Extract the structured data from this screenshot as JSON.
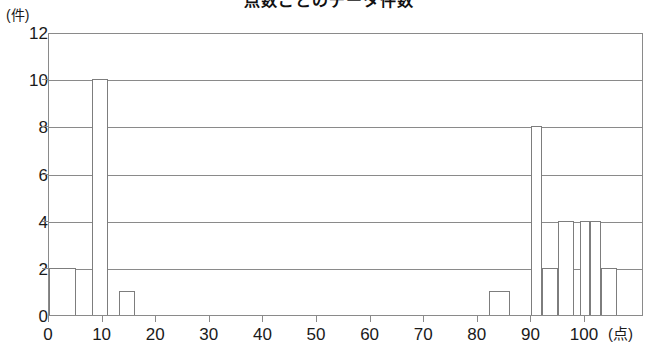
{
  "chart_data": {
    "type": "bar",
    "title": "点数ごとのデータ件数",
    "xlabel": "点",
    "ylabel": "件",
    "x_unit_label": "(点)",
    "y_unit_label": "(件)",
    "xlim": [
      0,
      111
    ],
    "ylim": [
      0,
      12
    ],
    "grid": true,
    "legend": null,
    "x_ticks": [
      0,
      10,
      20,
      30,
      40,
      50,
      60,
      70,
      80,
      90,
      100
    ],
    "y_ticks": [
      0,
      2,
      4,
      6,
      8,
      10,
      12
    ],
    "bin_width": 5,
    "bins": [
      {
        "start": 0,
        "end": 5,
        "value": 2
      },
      {
        "start": 8,
        "end": 11,
        "value": 10
      },
      {
        "start": 13,
        "end": 16,
        "value": 1
      },
      {
        "start": 82,
        "end": 86,
        "value": 1
      },
      {
        "start": 90,
        "end": 92,
        "value": 8
      },
      {
        "start": 92,
        "end": 95,
        "value": 2
      },
      {
        "start": 95,
        "end": 98,
        "value": 4
      },
      {
        "start": 99,
        "end": 101,
        "value": 4
      },
      {
        "start": 101,
        "end": 103,
        "value": 4
      },
      {
        "start": 103,
        "end": 106,
        "value": 2
      }
    ],
    "colors": {
      "bar_fill": "#ffffff",
      "bar_stroke": "#7d7d7d",
      "axis": "#8a8a8a",
      "text": "#1a1a1a"
    }
  }
}
